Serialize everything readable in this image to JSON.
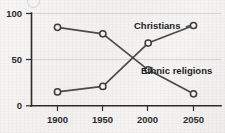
{
  "chart_data": {
    "type": "line",
    "title": "",
    "xlabel": "",
    "ylabel": "",
    "x": [
      1900,
      1950,
      2000,
      2050
    ],
    "categories": [
      "1900",
      "1950",
      "2000",
      "2050"
    ],
    "xlim": [
      1880,
      2070
    ],
    "ylim": [
      0,
      100
    ],
    "yticks": [
      0,
      50,
      100
    ],
    "ytick_labels": [
      "0",
      "50",
      "100"
    ],
    "xticks": [
      1900,
      1950,
      2000,
      2050
    ],
    "xtick_labels": [
      "1900",
      "1950",
      "2000",
      "2050"
    ],
    "grid": "horizontal",
    "legend_position": "inline-annotations",
    "series": [
      {
        "name": "Christians",
        "values": [
          15,
          21,
          68,
          87
        ],
        "label_text": "Christians",
        "marker": "open-circle"
      },
      {
        "name": "Ethnic religions",
        "values": [
          85,
          78,
          39,
          13
        ],
        "label_text": "Ethnic religions",
        "marker": "open-circle"
      }
    ],
    "annotations": [
      {
        "text": "Christians",
        "x": 2012,
        "y": 93
      },
      {
        "text": "Ethnic religions",
        "x": 2007,
        "y": 44
      }
    ],
    "colors": {
      "line": "#4a4a4a",
      "marker_fill": "#f2f1ef",
      "marker_stroke": "#3a3a3a",
      "axis": "#2b2b2b",
      "grid": "#c9c8c6",
      "background": "#f4f3f1",
      "text": "#1f1f1f"
    }
  },
  "axis": {
    "y_tick_100": "100",
    "y_tick_50": "50",
    "y_tick_0": "0",
    "x_tick_1900": "1900",
    "x_tick_1950": "1950",
    "x_tick_2000": "2000",
    "x_tick_2050": "2050"
  },
  "labels": {
    "christians": "Christians",
    "ethnic_religions": "Ethnic religions"
  }
}
